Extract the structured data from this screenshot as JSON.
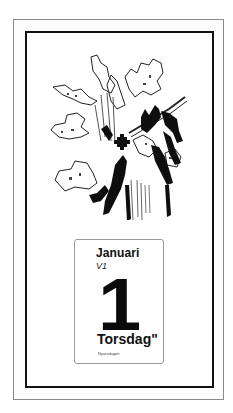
{
  "calendar": {
    "month": "Januari",
    "week": "V1",
    "day_number": "1",
    "weekday": "Torsdag\"",
    "holiday": "Nyårsdagen"
  },
  "illustration": {
    "subject": "flower-bouquet-pixel-art",
    "colors": {
      "ink": "#111111",
      "paper": "#ffffff",
      "frame": "#111111",
      "outer_frame": "#8a8a8a"
    }
  }
}
